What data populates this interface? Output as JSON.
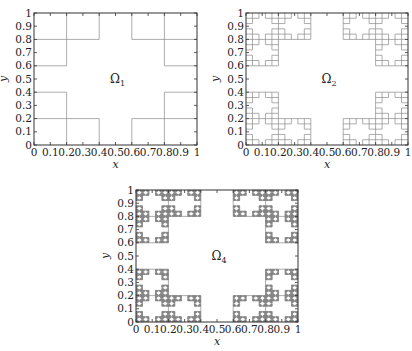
{
  "figure": {
    "panels": [
      {
        "id": "omega1",
        "label": "Ω",
        "subscript": "1",
        "level": 1,
        "frame": {
          "x": 34,
          "y": 13,
          "w": 163,
          "h": 132
        },
        "label_pos": {
          "x": 0.5,
          "y": 0.5
        }
      },
      {
        "id": "omega2",
        "label": "Ω",
        "subscript": "2",
        "level": 2,
        "frame": {
          "x": 246,
          "y": 13,
          "w": 162,
          "h": 132
        },
        "label_pos": {
          "x": 0.5,
          "y": 0.5
        }
      },
      {
        "id": "omega4",
        "label": "Ω",
        "subscript": "4",
        "level": 4,
        "frame": {
          "x": 136,
          "y": 190,
          "w": 162,
          "h": 132
        },
        "label_pos": {
          "x": 0.5,
          "y": 0.5
        }
      }
    ],
    "x_axis": {
      "label": "x",
      "ticks": [
        "0",
        "0.1",
        "0.2",
        "0.3",
        "0.4",
        "0.5",
        "0.6",
        "0.7",
        "0.8",
        "0.9",
        "1"
      ],
      "range": [
        0,
        1
      ]
    },
    "y_axis": {
      "label": "y",
      "ticks": [
        "0",
        "0.1",
        "0.2",
        "0.3",
        "0.4",
        "0.5",
        "0.6",
        "0.7",
        "0.8",
        "0.9",
        "1"
      ],
      "range": [
        0,
        1
      ]
    },
    "colors": {
      "frame": "#333333",
      "boundary": "#8a8a8a",
      "text": "#222222"
    }
  }
}
